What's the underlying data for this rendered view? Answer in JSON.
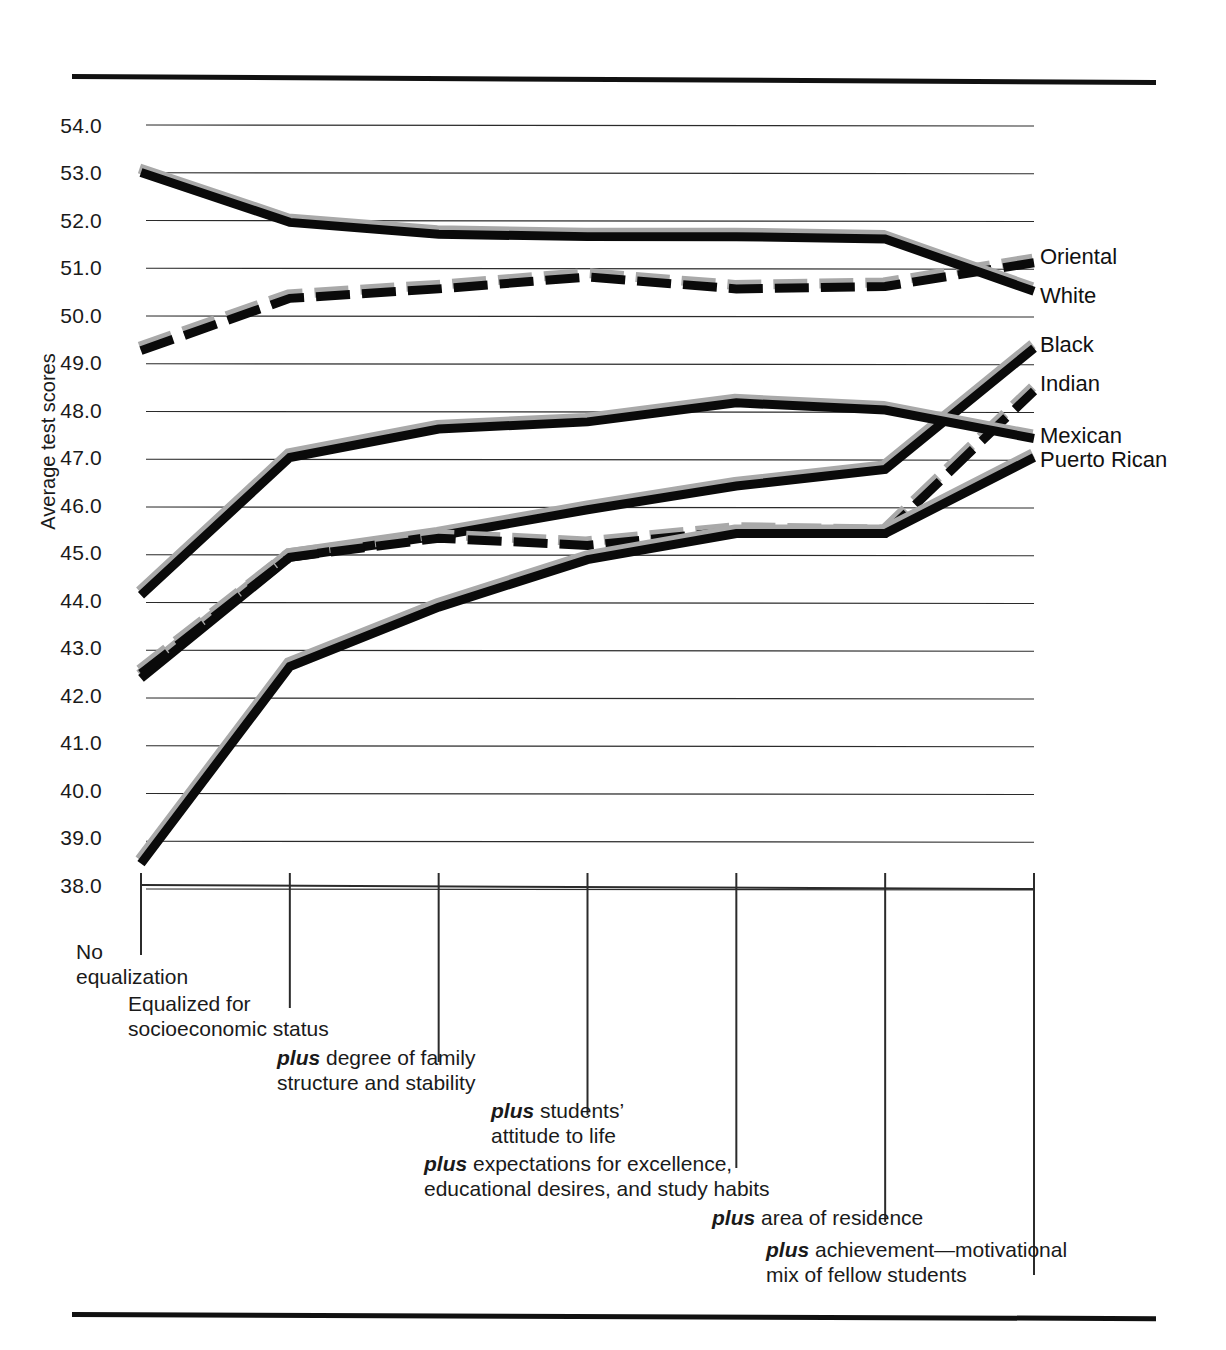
{
  "figure": {
    "y_axis_title": "Average test scores",
    "y_ticks": [
      "54.0",
      "53.0",
      "52.0",
      "51.0",
      "50.0",
      "49.0",
      "48.0",
      "47.0",
      "46.0",
      "45.0",
      "44.0",
      "43.0",
      "42.0",
      "41.0",
      "40.0",
      "39.0",
      "38.0"
    ],
    "series_labels": [
      "Oriental",
      "White",
      "Black",
      "Indian",
      "Mexican",
      "Puerto Rican"
    ],
    "x_captions": [
      {
        "pre": "",
        "bold": "",
        "rest": "No\nequalization"
      },
      {
        "pre": "",
        "bold": "",
        "rest": "Equalized for\nsocioeconomic status"
      },
      {
        "pre": "",
        "bold": "plus",
        "rest": " degree of family\nstructure and stability"
      },
      {
        "pre": "",
        "bold": "plus",
        "rest": " students’\nattitude to life"
      },
      {
        "pre": "",
        "bold": "plus",
        "rest": " expectations for excellence,\neducational desires, and study habits"
      },
      {
        "pre": "",
        "bold": "plus",
        "rest": " area of residence"
      },
      {
        "pre": "",
        "bold": "plus",
        "rest": " achievement—motivational\nmix of fellow students"
      }
    ]
  },
  "chart_data": {
    "type": "line",
    "title": "",
    "xlabel": "",
    "ylabel": "Average test scores",
    "ylim": [
      38.0,
      54.0
    ],
    "grid": true,
    "legend_position": "right-of-plot (inline line-end labels)",
    "categories": [
      "No equalization",
      "Equalized for socioeconomic status",
      "plus degree of family structure and stability",
      "plus students’ attitude to life",
      "plus expectations for excellence, educational desires, and study habits",
      "plus area of residence",
      "plus achievement—motivational mix of fellow students"
    ],
    "series": [
      {
        "name": "Oriental",
        "style": "dashed",
        "values": [
          49.25,
          50.35,
          50.55,
          50.8,
          50.55,
          50.6,
          51.1
        ]
      },
      {
        "name": "White",
        "style": "solid",
        "values": [
          53.0,
          51.95,
          51.7,
          51.65,
          51.65,
          51.6,
          50.5
        ]
      },
      {
        "name": "Black",
        "style": "solid",
        "values": [
          42.35,
          44.9,
          45.35,
          45.9,
          46.4,
          46.75,
          49.3
        ]
      },
      {
        "name": "Indian",
        "style": "dashed",
        "values": [
          42.45,
          44.9,
          45.3,
          45.15,
          45.45,
          45.4,
          48.4
        ]
      },
      {
        "name": "Mexican",
        "style": "solid",
        "values": [
          44.1,
          47.0,
          47.6,
          47.75,
          48.15,
          48.0,
          47.4
        ]
      },
      {
        "name": "Puerto Rican",
        "style": "solid",
        "values": [
          38.45,
          42.6,
          43.85,
          44.85,
          45.4,
          45.4,
          47.0
        ]
      }
    ]
  }
}
